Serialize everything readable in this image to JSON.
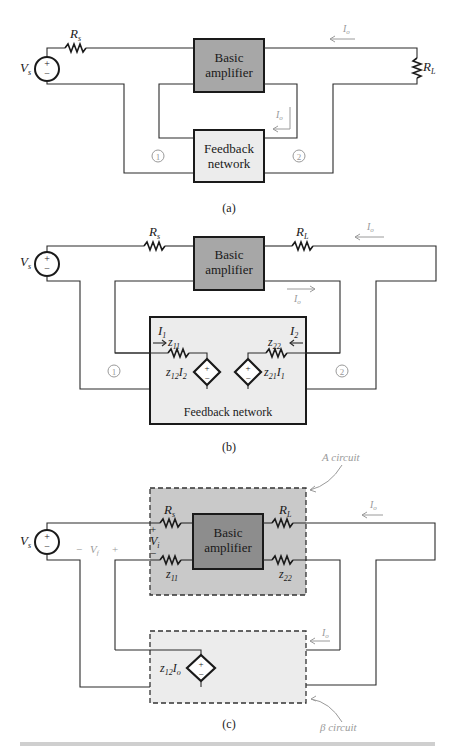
{
  "figure": {
    "panels": [
      {
        "id": "a",
        "label": "(a)",
        "blocks": {
          "amplifier": [
            "Basic",
            "amplifier"
          ],
          "feedback": [
            "Feedback",
            "network"
          ]
        },
        "source_label": "V",
        "source_sub": "s",
        "rs_label": "R",
        "rs_sub": "s",
        "rl_label": "R",
        "rl_sub": "L",
        "current_label": "I",
        "current_sub": "o",
        "port1": "1",
        "port2": "2"
      },
      {
        "id": "b",
        "label": "(b)",
        "blocks": {
          "amplifier": [
            "Basic",
            "amplifier"
          ],
          "feedback": "Feedback network"
        },
        "source_label": "V",
        "source_sub": "s",
        "rs_label": "R",
        "rs_sub": "s",
        "rl_label": "R",
        "rl_sub": "L",
        "current_label": "I",
        "current_sub": "o",
        "i1": "I",
        "i1_sub": "1",
        "i2": "I",
        "i2_sub": "2",
        "z11": "z",
        "z11_sub": "11",
        "z22": "z",
        "z22_sub": "22",
        "z12_src": "z",
        "z12_src_sub": "12",
        "z12_src_i": "I",
        "z12_src_i_sub": "2",
        "z21_src": "z",
        "z21_src_sub": "21",
        "z21_src_i": "I",
        "z21_src_i_sub": "1",
        "port1": "1",
        "port2": "2"
      },
      {
        "id": "c",
        "label": "(c)",
        "blocks": {
          "amplifier": [
            "Basic",
            "amplifier"
          ]
        },
        "source_label": "V",
        "source_sub": "s",
        "rs_label": "R",
        "rs_sub": "s",
        "rl_label": "R",
        "rl_sub": "L",
        "z11": "z",
        "z11_sub": "11",
        "z22": "z",
        "z22_sub": "22",
        "vi_label": "V",
        "vi_sub": "i",
        "vf_label": "V",
        "vf_sub": "f",
        "plus": "+",
        "minus": "−",
        "current_label": "I",
        "current_sub": "o",
        "z12_src": "z",
        "z12_src_sub": "12",
        "z12_src_i": "I",
        "z12_src_i_sub": "o",
        "a_circuit": "A circuit",
        "beta_circuit": "β circuit"
      }
    ],
    "source_symbol": {
      "plus": "+",
      "minus": "−"
    }
  }
}
